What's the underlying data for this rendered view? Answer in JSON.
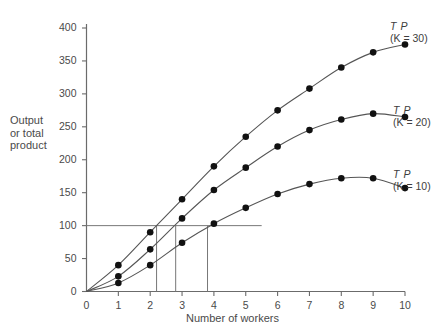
{
  "chart_data": {
    "type": "line",
    "title": "",
    "subtitle": "",
    "xlabel": "Number of workers",
    "ylabel": "Output or total product",
    "ylabel_lines": [
      "Output",
      "or total",
      "product"
    ],
    "xlim": [
      0,
      10
    ],
    "ylim": [
      0,
      400
    ],
    "xticks": [
      0,
      1,
      2,
      3,
      4,
      5,
      6,
      7,
      8,
      9,
      10
    ],
    "xtick_labels": [
      "0",
      "1",
      "2",
      "3",
      "4",
      "5",
      "6",
      "7",
      "8",
      "9",
      "10"
    ],
    "yticks": [
      0,
      50,
      100,
      150,
      200,
      250,
      300,
      350,
      400
    ],
    "ytick_labels": [
      "0",
      "50",
      "100",
      "150",
      "200",
      "250",
      "300",
      "350",
      "400"
    ],
    "grid": false,
    "legend_position": "right-of-curve-ends",
    "x": [
      0,
      1,
      2,
      3,
      4,
      5,
      6,
      7,
      8,
      9,
      10
    ],
    "series": [
      {
        "name": "TP (K = 30)",
        "label_line1": "T P",
        "label_line2": "(K = 30)",
        "capital": 30,
        "color": "#555555",
        "marker": "circle",
        "values": [
          0,
          40,
          90,
          140,
          190,
          235,
          275,
          308,
          340,
          363,
          375
        ]
      },
      {
        "name": "TP (K = 20)",
        "label_line1": "T P",
        "label_line2": "(K = 20)",
        "capital": 20,
        "color": "#555555",
        "marker": "circle",
        "values": [
          0,
          23,
          64,
          111,
          154,
          188,
          220,
          245,
          261,
          270,
          265
        ]
      },
      {
        "name": "TP (K = 10)",
        "label_line1": "T P",
        "label_line2": "(K = 10)",
        "capital": 10,
        "color": "#555555",
        "marker": "circle",
        "values": [
          0,
          13,
          40,
          74,
          103,
          127,
          148,
          163,
          172,
          172,
          157
        ]
      }
    ],
    "reference_lines": {
      "horizontal": {
        "y": 100,
        "x_start": 0,
        "x_end": 5.5
      },
      "verticals": [
        {
          "x": 2.2,
          "y_top": 100,
          "series": "TP (K = 30)"
        },
        {
          "x": 2.8,
          "y_top": 100,
          "series": "TP (K = 20)"
        },
        {
          "x": 3.8,
          "y_top": 100,
          "series": "TP (K = 10)"
        }
      ]
    },
    "colors": {
      "axis": "#6b6b6b",
      "curve": "#555555",
      "marker": "#111111",
      "reference_line": "#777777",
      "text": "#4a4a4a",
      "background": "#ffffff"
    }
  }
}
